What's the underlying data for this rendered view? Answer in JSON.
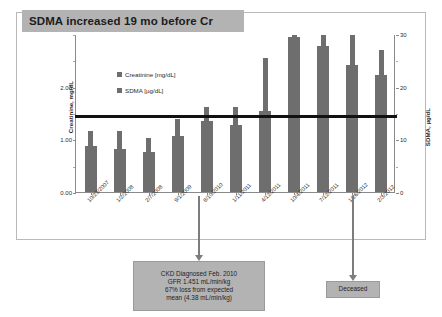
{
  "chart_data": {
    "type": "bar",
    "title": "SDMA increased 19 mo before Cr",
    "xlabel": "",
    "ylabel": "Creatinine, mg/dL",
    "y2label": "SDMA, µg/dL",
    "grid": false,
    "legend_position": "inside-upper-left",
    "categories": [
      "10/23/2007",
      "1/2/2008",
      "2/7/2008",
      "9/1/2009",
      "8/10/2010",
      "1/11/2011",
      "4/12/2011",
      "10/4/2011",
      "7/12/2011",
      "1/26/2012",
      "2/3/2012"
    ],
    "series": [
      {
        "name": "Creatinine [mg/dL]",
        "axis": "left",
        "unit": "mg/dL",
        "values": [
          0.88,
          0.82,
          0.76,
          1.06,
          1.34,
          1.27,
          1.54,
          2.95,
          2.77,
          2.42,
          2.22
        ]
      },
      {
        "name": "SDMA [µg/dL]",
        "axis": "right",
        "unit": "µg/dL",
        "values": [
          11.5,
          11.5,
          10.2,
          13.9,
          16.2,
          16.2,
          25.5,
          29.8,
          29.9,
          29.8,
          27.0
        ]
      }
    ],
    "ylim": [
      0.0,
      3.0
    ],
    "yticks": [
      0.0,
      1.0,
      2.0
    ],
    "ytick_labels": [
      "0.00",
      "1.00",
      "2.00"
    ],
    "y2lim": [
      0,
      30
    ],
    "y2ticks": [
      0,
      10,
      20,
      30
    ],
    "y2tick_labels": [
      "0",
      "10",
      "20",
      "30"
    ],
    "reference_line": {
      "name": "creatinine-upper-reference",
      "axis": "left",
      "value": 1.45
    },
    "annotations": [
      {
        "name": "ckd-diagnosis-callout",
        "at_category": "8/10/2010",
        "lines": [
          "CKD Diagnosed Feb. 2010",
          "GFR 1.451 mL/min/kg",
          "67% loss from expected",
          "mean (4.38 mL/min/kg)"
        ]
      },
      {
        "name": "deceased-callout",
        "at_category": "2/3/2012",
        "lines": [
          "Deceased"
        ]
      }
    ]
  },
  "colors": {
    "bar": "#6e6e6e",
    "banner": "#b3b3b3",
    "reference_line": "#111111",
    "arrow": "#7d7d7d",
    "axis": "#8a8a8a",
    "frame": "#b9b9b9"
  }
}
